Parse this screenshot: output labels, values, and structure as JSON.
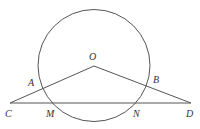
{
  "diagram": {
    "type": "geometry",
    "background": "#ffffff",
    "stroke_color": "#555555",
    "circle": {
      "center": "O",
      "cx": 94,
      "cy": 65.5,
      "r": 56
    },
    "points": {
      "O": {
        "label": "O",
        "x": 94,
        "y": 66
      },
      "A": {
        "label": "A",
        "x": 44,
        "y": 87
      },
      "B": {
        "label": "B",
        "x": 147,
        "y": 85
      },
      "C": {
        "label": "C",
        "x": 10,
        "y": 103
      },
      "D": {
        "label": "D",
        "x": 191,
        "y": 103
      },
      "M": {
        "label": "M",
        "x": 53,
        "y": 103
      },
      "N": {
        "label": "N",
        "x": 136,
        "y": 103
      }
    },
    "segments": [
      "OC",
      "OD",
      "CD"
    ],
    "labels": {
      "O": "O",
      "A": "A",
      "B": "B",
      "C": "C",
      "D": "D",
      "M": "M",
      "N": "N"
    }
  }
}
